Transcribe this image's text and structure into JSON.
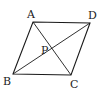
{
  "figure": {
    "type": "parallelogram",
    "points": {
      "A": {
        "x": 33,
        "y": 22
      },
      "D": {
        "x": 90,
        "y": 23
      },
      "B": {
        "x": 13,
        "y": 74
      },
      "C": {
        "x": 71,
        "y": 75
      },
      "P": {
        "x": 44,
        "y": 42
      }
    },
    "labels": {
      "A": "A",
      "B": "B",
      "C": "C",
      "D": "D",
      "P": "P"
    },
    "segments": [
      "AD",
      "DC",
      "CB",
      "BA",
      "AC",
      "BD"
    ],
    "stroke_color": "#1a1a1a",
    "background": "#ffffff"
  }
}
